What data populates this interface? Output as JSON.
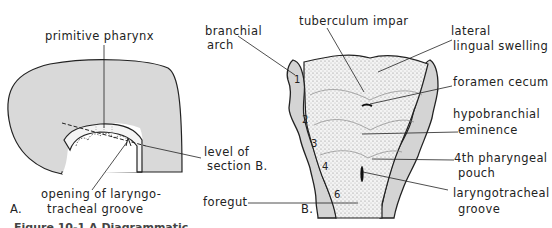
{
  "panel_a": {
    "panel_label": "A.",
    "labels": {
      "primitive_pharynx": "primitive pharynx",
      "level_of": "level of",
      "section_b": "section B.",
      "opening_line1": "opening of laryngo-",
      "opening_line2": "tracheal groove"
    }
  },
  "panel_b": {
    "panel_label": "B.",
    "labels": {
      "branchial_line1": "branchial",
      "branchial_line2": "arch",
      "tuberculum_impar": "tuberculum impar",
      "lateral_line1": "lateral",
      "lateral_line2": "lingual swelling",
      "foramen_cecum": "foramen cecum",
      "hypobranchial_line1": "hypobranchial",
      "hypobranchial_line2": "eminence",
      "pouch_line1": "4th pharyngeal",
      "pouch_line2": "pouch",
      "laryngo_line1": "laryngotracheal",
      "laryngo_line2": "groove",
      "foregut": "foregut"
    },
    "arch_numbers": [
      "1",
      "2",
      "3",
      "4",
      "6"
    ]
  },
  "caption_fragment": "Figure 10-1  A  Diagrammatic ...",
  "colors": {
    "embryo_fill": "#d9d9d9",
    "line": "#222222",
    "arch_fill": "#d4d4d4"
  }
}
